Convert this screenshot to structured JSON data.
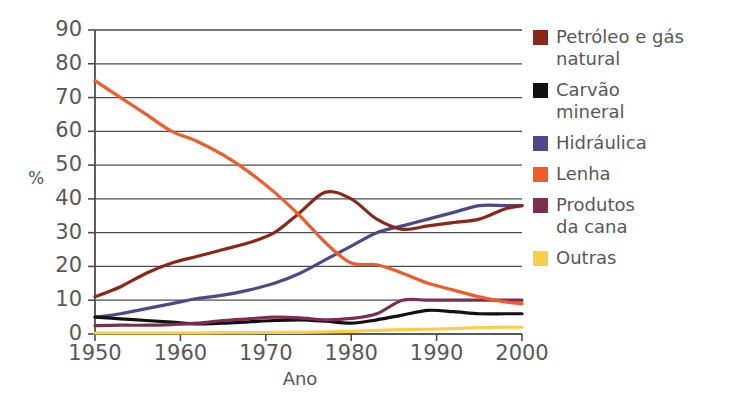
{
  "chart_data": {
    "type": "line",
    "title": "",
    "xlabel": "Ano",
    "ylabel": "%",
    "xlim": [
      1950,
      2000
    ],
    "ylim": [
      0,
      90
    ],
    "grid": true,
    "legend_position": "right",
    "x_ticks": [
      "1950",
      "1960",
      "1970",
      "1980",
      "1990",
      "2000"
    ],
    "y_ticks": [
      "0",
      "10",
      "20",
      "30",
      "40",
      "50",
      "60",
      "70",
      "80",
      "90"
    ],
    "x": [
      1950,
      1953,
      1956,
      1959,
      1962,
      1965,
      1968,
      1971,
      1974,
      1977,
      1980,
      1983,
      1986,
      1989,
      1992,
      1995,
      1998,
      2000
    ],
    "series": [
      {
        "name": "Petróleo e gás natural",
        "label": "Petróleo e gás\nnatural",
        "color": "#8B2718",
        "values": [
          11,
          14,
          18,
          21,
          23,
          25,
          27,
          30,
          36,
          42,
          40,
          34,
          31,
          32,
          33,
          34,
          37,
          38
        ]
      },
      {
        "name": "Carvão mineral",
        "label": "Carvão\nmineral",
        "color": "#111111",
        "values": [
          5,
          4.5,
          4,
          3.5,
          3,
          3.2,
          3.6,
          4,
          4.2,
          3.8,
          3.2,
          4.2,
          5.6,
          7,
          6.6,
          6,
          6,
          6
        ]
      },
      {
        "name": "Hidráulica",
        "label": "Hidráulica",
        "color": "#4A4A8A",
        "values": [
          5,
          6,
          7.5,
          9,
          10.5,
          11.5,
          13,
          15,
          18,
          22,
          26,
          30,
          32,
          34,
          36,
          38,
          38,
          38
        ]
      },
      {
        "name": "Lenha",
        "label": "Lenha",
        "color": "#F15A29",
        "values": [
          75,
          70,
          65,
          60,
          57,
          53,
          48,
          42,
          35,
          27,
          21,
          20.5,
          18,
          15,
          13,
          11,
          9.5,
          9
        ]
      },
      {
        "name": "Produtos da cana",
        "label": "Produtos\nda cana",
        "color": "#7B2D52",
        "values": [
          2.5,
          2.6,
          2.6,
          2.8,
          3.2,
          4,
          4.5,
          5,
          4.8,
          4.2,
          4.6,
          6,
          10,
          10,
          10,
          10,
          10,
          10
        ]
      },
      {
        "name": "Outras",
        "label": "Outras",
        "color": "#FBCE48",
        "values": [
          0.3,
          0.3,
          0.3,
          0.3,
          0.3,
          0.4,
          0.4,
          0.5,
          0.5,
          0.6,
          0.8,
          1.1,
          1.3,
          1.4,
          1.6,
          1.9,
          2,
          2
        ]
      }
    ]
  },
  "axes": {
    "y_title": "%",
    "x_title": "Ano"
  },
  "legend": {
    "items": [
      {
        "label": "Petróleo e gás\nnatural",
        "color": "#8B2718",
        "name": "petroleo-e-gas-natural"
      },
      {
        "label": "Carvão\nmineral",
        "color": "#111111",
        "name": "carvao-mineral"
      },
      {
        "label": "Hidráulica",
        "color": "#4A4A8A",
        "name": "hidraulica"
      },
      {
        "label": "Lenha",
        "color": "#F15A29",
        "name": "lenha"
      },
      {
        "label": "Produtos\nda cana",
        "color": "#7B2D52",
        "name": "produtos-da-cana"
      },
      {
        "label": "Outras",
        "color": "#FBCE48",
        "name": "outras"
      }
    ]
  },
  "colors": {
    "gridline": "#4d4d4d",
    "axis": "#4d4d4d",
    "text": "#58585a",
    "background": "#ffffff"
  }
}
